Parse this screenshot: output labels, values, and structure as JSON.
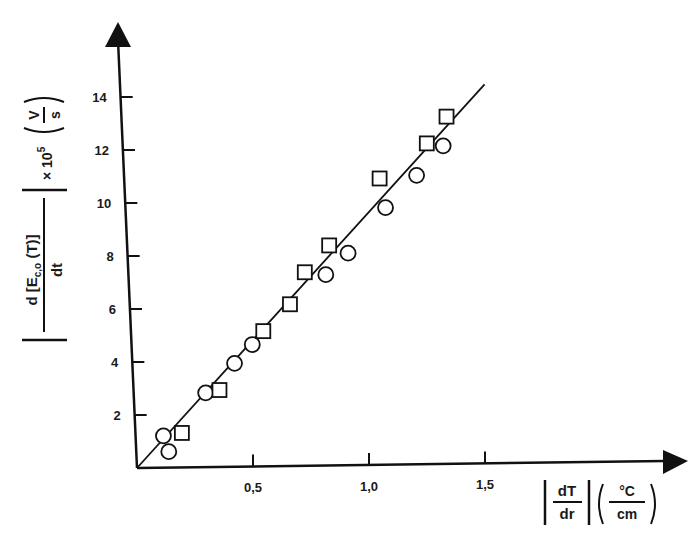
{
  "chart_data": {
    "type": "scatter",
    "title": "",
    "xlabel": "|dT/dr| (°C/cm)",
    "ylabel": "|d[E_c,o(T)]/dt| × 10^5 (V/s)",
    "xlabel_parts": {
      "num": "dT",
      "den": "dr",
      "unit_num": "°C",
      "unit_den": "cm"
    },
    "ylabel_parts": {
      "num": "d [E",
      "sub": "c,o",
      "num_tail": " (T)]",
      "den": "dt",
      "scale": "× 10",
      "exp": "5",
      "unit_num": "V",
      "unit_den": "s"
    },
    "xlim": [
      0,
      1.75
    ],
    "ylim": [
      0,
      16
    ],
    "x_ticks": [
      0.5,
      1.0,
      1.5
    ],
    "x_tick_labels": [
      "0,5",
      "1,0",
      "1,5"
    ],
    "y_ticks": [
      2,
      4,
      6,
      8,
      10,
      12,
      14
    ],
    "y_tick_labels": [
      "2",
      "4",
      "6",
      "8",
      "10",
      "12",
      "14"
    ],
    "grid": false,
    "legend": null,
    "series": [
      {
        "name": "circles",
        "marker": "circle",
        "x": [
          0.12,
          0.14,
          0.31,
          0.44,
          0.52,
          0.85,
          0.95,
          1.12,
          1.26,
          1.38
        ],
        "y": [
          1.2,
          0.6,
          2.8,
          3.9,
          4.6,
          7.2,
          8.0,
          9.7,
          10.9,
          12.0
        ]
      },
      {
        "name": "squares",
        "marker": "square",
        "x": [
          0.2,
          0.37,
          0.57,
          0.69,
          0.76,
          0.87,
          1.1,
          1.31,
          1.4
        ],
        "y": [
          1.3,
          2.9,
          5.1,
          6.1,
          7.3,
          8.3,
          10.8,
          12.1,
          13.1
        ]
      },
      {
        "name": "linear fit",
        "marker": "line",
        "x": [
          0,
          1.57
        ],
        "y": [
          0,
          14.3
        ]
      }
    ]
  }
}
